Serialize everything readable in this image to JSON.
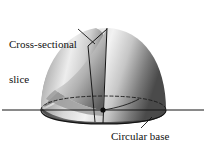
{
  "figure": {
    "background_color": "#ffffff",
    "ink_color": "#121212",
    "labels": {
      "cross_sectional": {
        "line1": "Cross-sectional",
        "line2": "slice"
      },
      "circular_base": "Circular base"
    },
    "annotations": {
      "leader_cross_sectional": "leader-line",
      "leader_circular_base": "leader-line",
      "center_point": "center-dot",
      "axis": "horizontal-axis-line"
    },
    "geometry": {
      "solid_type": "paraboloid dome",
      "apex": {
        "x": 107,
        "y": 28
      },
      "base_center": {
        "x": 103,
        "y": 110
      },
      "base_rx": 62,
      "base_ry": 13,
      "axis_y": 110,
      "axis_x_start": 2,
      "axis_x_end": 204,
      "slice_plane": "vertical cut through apex to base center"
    },
    "shading": {
      "surface_dark": "#3a3a3a",
      "surface_mid": "#8e8e8e",
      "surface_light": "#e8e8e8",
      "cut_face_light": "#f0f0f0",
      "cut_face_mid": "#b4b4b4",
      "cut_face_dark": "#6e6e6e",
      "base_shadow": "#2e2e2e"
    }
  }
}
